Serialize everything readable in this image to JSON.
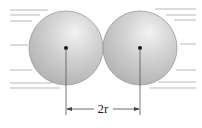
{
  "diagram": {
    "title": "",
    "dimension_label": "2r",
    "colors": {
      "sphere_fill": "#c8c8c8",
      "sphere_highlight": "#eeeeee",
      "sphere_edge": "#9a9a9a",
      "flow_lines": "#b5b5b5",
      "center_dot": "#111111",
      "dimension_line": "#444444"
    },
    "spheres": [
      {
        "name": "left-sphere",
        "cx": 66,
        "cy": 48,
        "r": 37
      },
      {
        "name": "right-sphere",
        "cx": 140,
        "cy": 48,
        "r": 37
      }
    ]
  }
}
